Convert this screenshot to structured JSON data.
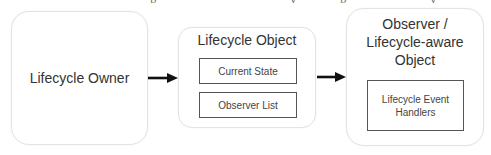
{
  "diagram": {
    "nodes": {
      "owner": {
        "label": "Lifecycle Owner"
      },
      "lifecycle": {
        "title": "Lifecycle Object",
        "children": [
          {
            "label": "Current State"
          },
          {
            "label": "Observer List"
          }
        ]
      },
      "observer": {
        "title_lines": [
          "Observer /",
          "Lifecycle-aware",
          "Object"
        ],
        "children": [
          {
            "label_lines": [
              "Lifecycle Event",
              "Handlers"
            ]
          }
        ]
      }
    },
    "edges": [
      {
        "from": "Lifecycle Owner",
        "to": "Lifecycle Object",
        "style": "solid-arrow"
      },
      {
        "from": "Lifecycle Object",
        "to": "Observer / Lifecycle-aware Object",
        "style": "solid-arrow"
      }
    ],
    "colors": {
      "outer_border": "#e3e3e3",
      "inner_border": "#555555",
      "arrow": "#111111",
      "text": "#333333"
    }
  }
}
